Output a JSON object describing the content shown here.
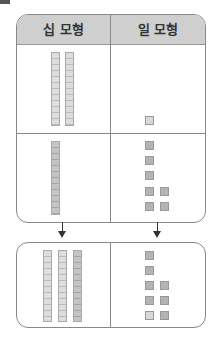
{
  "header": {
    "tens_label": "십 모형",
    "ones_label": "일 모형"
  },
  "rows": [
    {
      "tens": 2,
      "ones": 1
    },
    {
      "tens": 1,
      "ones": 7
    }
  ],
  "result": {
    "tens": 3,
    "ones": 8
  },
  "colors": {
    "header_bg": "#cfcfcf",
    "border": "#888888",
    "block": "#b4b4b4"
  }
}
